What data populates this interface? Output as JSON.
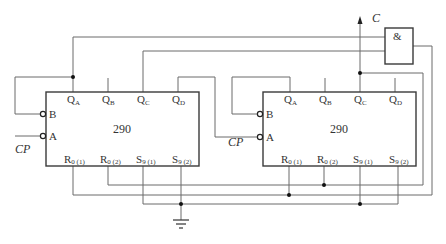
{
  "diagram": {
    "type": "logic circuit schematic",
    "colors": {
      "wire": "#6a6a6a",
      "outline": "#3a3a3a",
      "junction": "#111111",
      "background": "#ffffff"
    },
    "left_chip": {
      "name": "290",
      "outputs": {
        "qa": "Q",
        "qa_sub": "A",
        "qb": "Q",
        "qb_sub": "B",
        "qc": "Q",
        "qc_sub": "C",
        "qd": "Q",
        "qd_sub": "D"
      },
      "inputs": {
        "b": "B",
        "a": "A"
      },
      "controls": {
        "r01": "R",
        "r01_sub": "0 (1)",
        "r02": "R",
        "r02_sub": "0 (2)",
        "s91": "S",
        "s91_sub": "9 (1)",
        "s92": "S",
        "s92_sub": "9 (2)"
      }
    },
    "right_chip": {
      "name": "290",
      "outputs": {
        "qa": "Q",
        "qa_sub": "A",
        "qb": "Q",
        "qb_sub": "B",
        "qc": "Q",
        "qc_sub": "C",
        "qd": "Q",
        "qd_sub": "D"
      },
      "inputs": {
        "b": "B",
        "a": "A"
      },
      "controls": {
        "r01": "R",
        "r01_sub": "0 (1)",
        "r02": "R",
        "r02_sub": "0 (2)",
        "s91": "S",
        "s91_sub": "9 (1)",
        "s92": "S",
        "s92_sub": "9 (2)"
      }
    },
    "and_gate": {
      "symbol": "&"
    },
    "labels": {
      "clock_left": "CP",
      "clock_right": "CP",
      "output": "C"
    }
  }
}
